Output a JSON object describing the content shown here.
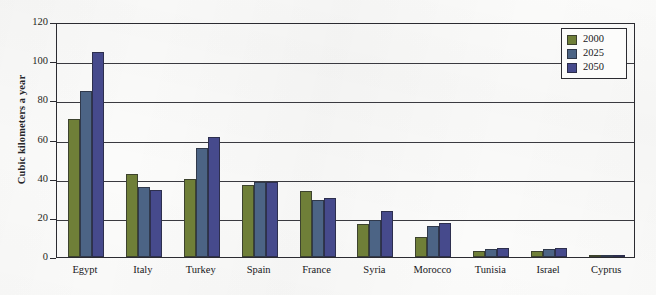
{
  "chart_data": {
    "type": "bar",
    "title": "",
    "xlabel": "",
    "ylabel": "Cubic kilometers a year",
    "ylim": [
      0,
      120
    ],
    "ytick_step": 20,
    "yticks": [
      0,
      20,
      40,
      60,
      80,
      100,
      120
    ],
    "grid": true,
    "legend_position": "top-right",
    "categories": [
      "Egypt",
      "Italy",
      "Turkey",
      "Spain",
      "France",
      "Syria",
      "Morocco",
      "Tunisia",
      "Israel",
      "Cyprus"
    ],
    "series": [
      {
        "name": "2000",
        "color": "#6f7f38",
        "values": [
          70.5,
          42.5,
          40.0,
          37.0,
          33.5,
          17.0,
          10.0,
          3.0,
          3.0,
          0.7
        ]
      },
      {
        "name": "2025",
        "color": "#4c6485",
        "values": [
          85.0,
          36.0,
          55.5,
          38.5,
          29.0,
          19.0,
          16.0,
          4.0,
          4.0,
          0.9
        ]
      },
      {
        "name": "2050",
        "color": "#464a8c",
        "values": [
          104.5,
          34.0,
          61.5,
          38.5,
          30.0,
          23.5,
          17.5,
          4.5,
          4.5,
          1.0
        ]
      }
    ]
  },
  "colors": {
    "series_2000": "#6f7f38",
    "series_2025": "#4c6485",
    "series_2050": "#464a8c",
    "axis": "#2b2b31",
    "background": "#fbfbfa"
  }
}
